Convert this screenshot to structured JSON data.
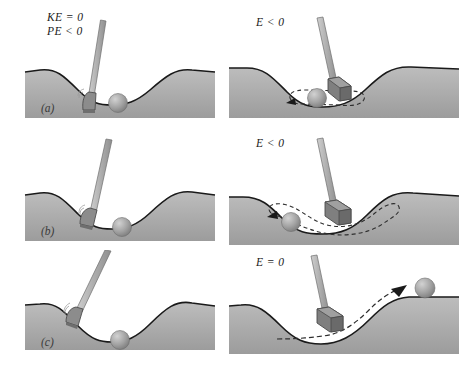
{
  "figure": {
    "rows": 3,
    "columns": 2,
    "background_color": "#ffffff",
    "terrain_color": "#a8a8a8",
    "terrain_edge_color": "#1a1a1a",
    "ball_color": "#9a9a9a",
    "club_shaft_color": "#b5b5b5",
    "club_head_color": "#8a8a8a",
    "dash_color": "#2a2a2a"
  },
  "panels": [
    {
      "id": "a-left",
      "row": 1,
      "column": "left",
      "part_label": "(a)",
      "energy_labels": [
        "KE = 0",
        "PE < 0"
      ],
      "club_present": true,
      "club_orientation": "tilted-right",
      "ball_state": "at rest in valley",
      "trajectory": "none",
      "description": "Club resting beside ball at the bottom of the valley; kinetic energy zero, potential energy negative."
    },
    {
      "id": "a-right",
      "row": 1,
      "column": "right",
      "part_label": "",
      "energy_labels": [
        "E < 0"
      ],
      "club_present": true,
      "club_orientation": "tilted-left",
      "ball_state": "oscillating near valley bottom",
      "trajectory": "small closed loop, arrow pointing left",
      "description": "Gentle tap: ball oscillates in a small region at the bottom of the well; total energy negative, ball is bound."
    },
    {
      "id": "b-left",
      "row": 2,
      "column": "left",
      "part_label": "(b)",
      "energy_labels": [],
      "club_present": true,
      "club_orientation": "tilted-right",
      "ball_state": "at rest in valley",
      "trajectory": "none",
      "description": "Club swung back ready to strike the ball at the valley bottom."
    },
    {
      "id": "b-right",
      "row": 2,
      "column": "right",
      "part_label": "",
      "energy_labels": [
        "E < 0"
      ],
      "club_present": true,
      "club_orientation": "tilted-left",
      "ball_state": "oscillating across the valley",
      "trajectory": "wide valley-shaped dashed loop, arrow pointing left",
      "description": "Harder strike: ball travels further up both sides but remains trapped; total energy still negative."
    },
    {
      "id": "c-left",
      "row": 3,
      "column": "left",
      "part_label": "(c)",
      "energy_labels": [],
      "club_present": true,
      "club_orientation": "tilted-right",
      "ball_state": "at rest in valley",
      "trajectory": "none",
      "description": "Club raised for the strongest strike on the resting ball."
    },
    {
      "id": "c-right",
      "row": 3,
      "column": "right",
      "part_label": "",
      "energy_labels": [
        "E = 0"
      ],
      "club_present": true,
      "club_orientation": "tilted-left",
      "ball_state": "escaping over the right hill",
      "trajectory": "dashed path rising out of the valley with arrowhead",
      "description": "Strike with just enough energy: ball climbs out of the well and escapes; total energy equals zero."
    }
  ]
}
